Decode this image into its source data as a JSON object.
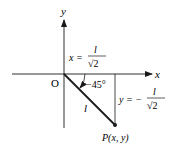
{
  "diagram": {
    "axes": {
      "x_label": "x",
      "y_label": "y",
      "origin_label": "O"
    },
    "segment_label": "l",
    "angle_label": "−45°",
    "point_label": "P(x, y)",
    "x_equation": {
      "lhs": "x =",
      "numerator": "l",
      "denominator": "√2"
    },
    "y_equation": {
      "lhs": "y = −",
      "numerator": "l",
      "denominator": "√2"
    },
    "colors": {
      "line": "#1a1a1a",
      "background": "#ffffff"
    }
  }
}
